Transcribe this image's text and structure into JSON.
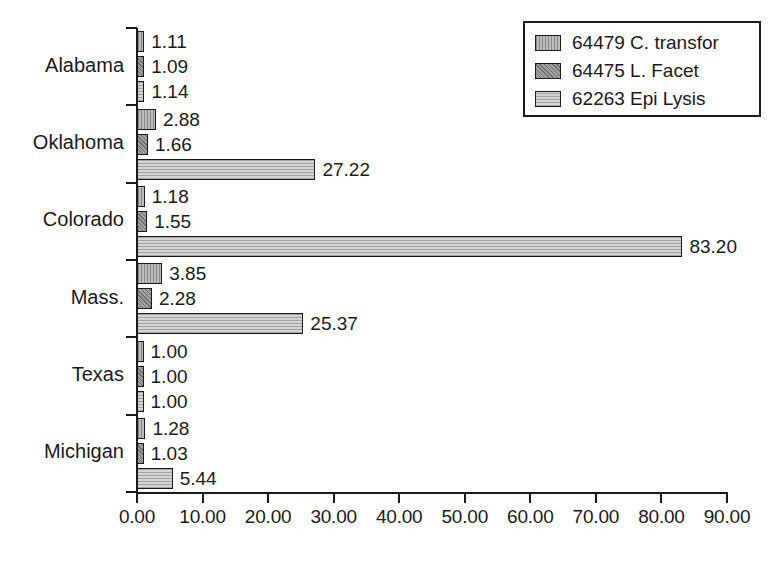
{
  "chart_data": {
    "type": "bar",
    "orientation": "horizontal",
    "title": "",
    "xlabel": "",
    "ylabel": "",
    "xlim": [
      0,
      90
    ],
    "xticks": [
      "0.00",
      "10.00",
      "20.00",
      "30.00",
      "40.00",
      "50.00",
      "60.00",
      "70.00",
      "80.00",
      "90.00"
    ],
    "xtick_values": [
      0,
      10,
      20,
      30,
      40,
      50,
      60,
      70,
      80,
      90
    ],
    "grid": false,
    "legend_position": "top-right",
    "categories": [
      "Alabama",
      "Oklahoma",
      "Colorado",
      "Mass.",
      "Texas",
      "Michigan"
    ],
    "series": [
      {
        "name": "64479 C. transfor",
        "color": "#a8a8a8",
        "values": [
          1.11,
          2.88,
          1.18,
          3.85,
          1.0,
          1.28
        ],
        "labels": [
          "1.11",
          "2.88",
          "1.18",
          "3.85",
          "1.00",
          "1.28"
        ]
      },
      {
        "name": "64475 L. Facet",
        "color": "#8c8c8c",
        "values": [
          1.09,
          1.66,
          1.55,
          2.28,
          1.0,
          1.03
        ],
        "labels": [
          "1.09",
          "1.66",
          "1.55",
          "2.28",
          "1.00",
          "1.03"
        ]
      },
      {
        "name": "62263 Epi Lysis",
        "color": "#c2c2c2",
        "values": [
          1.14,
          27.22,
          83.2,
          25.37,
          1.0,
          5.44
        ],
        "labels": [
          "1.14",
          "27.22",
          "83.20",
          "25.37",
          "1.00",
          "5.44"
        ]
      }
    ]
  },
  "legend": {
    "items": [
      {
        "label": "64479 C. transfor",
        "swatch_class": "s0"
      },
      {
        "label": "64475 L. Facet",
        "swatch_class": "s1"
      },
      {
        "label": "62263 Epi Lysis",
        "swatch_class": "s2"
      }
    ]
  },
  "axis": {
    "x_tick_labels": [
      "0.00",
      "10.00",
      "20.00",
      "30.00",
      "40.00",
      "50.00",
      "60.00",
      "70.00",
      "80.00",
      "90.00"
    ],
    "y_category_labels": [
      "Alabama",
      "Oklahoma",
      "Colorado",
      "Mass.",
      "Texas",
      "Michigan"
    ]
  },
  "colors": {
    "axis": "#1a1a1a",
    "background": "#ffffff",
    "series_1": "#a8a8a8",
    "series_2": "#8c8c8c",
    "series_3": "#c2c2c2"
  }
}
